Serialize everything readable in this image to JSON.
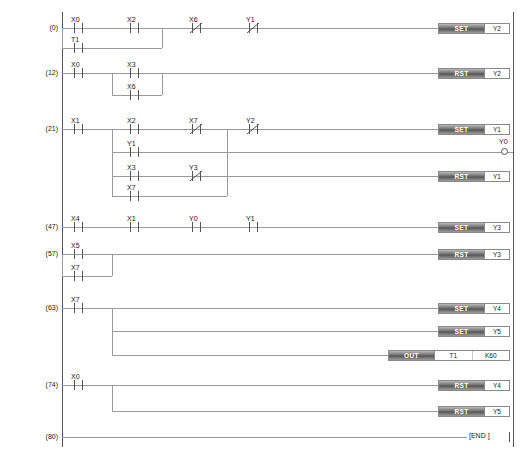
{
  "diagram": {
    "type": "ladder-logic",
    "end_label": "[END  ]",
    "rails": {
      "left_x": 62,
      "right_x": 513
    },
    "rungs": [
      {
        "step": "(0)",
        "y": 28,
        "contacts": [
          {
            "name": "X0",
            "x": 78,
            "type": "no"
          },
          {
            "name": "X2",
            "x": 134,
            "type": "no"
          },
          {
            "name": "X6",
            "x": 196,
            "type": "nc"
          },
          {
            "name": "Y1",
            "x": 253,
            "type": "nc"
          }
        ],
        "branches": [
          {
            "y": 48,
            "from_x": 62,
            "to_x": 162,
            "contacts": [
              {
                "name": "T1",
                "x": 78,
                "type": "no"
              }
            ]
          }
        ],
        "outputs": [
          {
            "op": "SET",
            "args": [
              "Y2"
            ],
            "y": 28
          }
        ]
      },
      {
        "step": "(12)",
        "y": 73,
        "contacts": [
          {
            "name": "X0",
            "x": 78,
            "type": "no"
          },
          {
            "name": "X3",
            "x": 134,
            "type": "no"
          }
        ],
        "branches": [
          {
            "y": 95,
            "from_x": 112,
            "to_x": 162,
            "contacts": [
              {
                "name": "X6",
                "x": 134,
                "type": "no"
              }
            ]
          }
        ],
        "outputs": [
          {
            "op": "RST",
            "args": [
              "Y2"
            ],
            "y": 73
          }
        ]
      },
      {
        "step": "(21)",
        "y": 129,
        "contacts": [
          {
            "name": "X1",
            "x": 78,
            "type": "no"
          },
          {
            "name": "X2",
            "x": 134,
            "type": "no"
          },
          {
            "name": "X7",
            "x": 196,
            "type": "nc"
          },
          {
            "name": "Y2",
            "x": 253,
            "type": "nc"
          }
        ],
        "branches": [
          {
            "y": 152,
            "from_x": 112,
            "to_x": 513,
            "contacts": [
              {
                "name": "Y1",
                "x": 134,
                "type": "no"
              }
            ]
          },
          {
            "y": 176,
            "from_x": 112,
            "to_x": 227,
            "contacts": [
              {
                "name": "X3",
                "x": 134,
                "type": "no"
              },
              {
                "name": "Y3",
                "x": 196,
                "type": "nc"
              }
            ]
          },
          {
            "y": 196,
            "from_x": 112,
            "to_x": 227,
            "contacts": [
              {
                "name": "X7",
                "x": 134,
                "type": "no"
              }
            ]
          }
        ],
        "outputs": [
          {
            "op": "SET",
            "args": [
              "Y1"
            ],
            "y": 129
          },
          {
            "op": "RST",
            "args": [
              "Y1"
            ],
            "y": 176
          }
        ],
        "coils": [
          {
            "name": "Y0",
            "y": 152
          }
        ]
      },
      {
        "step": "(47)",
        "y": 227,
        "contacts": [
          {
            "name": "X4",
            "x": 78,
            "type": "no"
          },
          {
            "name": "X1",
            "x": 134,
            "type": "no"
          },
          {
            "name": "Y0",
            "x": 196,
            "type": "no"
          },
          {
            "name": "Y1",
            "x": 253,
            "type": "no"
          }
        ],
        "branches": [],
        "outputs": [
          {
            "op": "SET",
            "args": [
              "Y3"
            ],
            "y": 227
          }
        ]
      },
      {
        "step": "(57)",
        "y": 254,
        "contacts": [
          {
            "name": "X5",
            "x": 78,
            "type": "no"
          }
        ],
        "branches": [
          {
            "y": 276,
            "from_x": 62,
            "to_x": 112,
            "contacts": [
              {
                "name": "X7",
                "x": 78,
                "type": "no"
              }
            ]
          }
        ],
        "outputs": [
          {
            "op": "RST",
            "args": [
              "Y3"
            ],
            "y": 254
          }
        ]
      },
      {
        "step": "(63)",
        "y": 308,
        "contacts": [
          {
            "name": "X7",
            "x": 78,
            "type": "no"
          }
        ],
        "branches": [
          {
            "y": 331,
            "from_x": 112,
            "to_x": 513,
            "contacts": []
          },
          {
            "y": 355,
            "from_x": 112,
            "to_x": 396,
            "contacts": []
          }
        ],
        "outputs": [
          {
            "op": "SET",
            "args": [
              "Y4"
            ],
            "y": 308
          },
          {
            "op": "SET",
            "args": [
              "Y5"
            ],
            "y": 331
          },
          {
            "op": "OUT",
            "args": [
              "T1",
              "K60"
            ],
            "y": 355
          }
        ]
      },
      {
        "step": "(74)",
        "y": 385,
        "contacts": [
          {
            "name": "X0",
            "x": 78,
            "type": "no"
          }
        ],
        "branches": [
          {
            "y": 411,
            "from_x": 112,
            "to_x": 513,
            "contacts": []
          }
        ],
        "outputs": [
          {
            "op": "RST",
            "args": [
              "Y4"
            ],
            "y": 385
          },
          {
            "op": "RST",
            "args": [
              "Y5"
            ],
            "y": 411
          }
        ]
      },
      {
        "step": "(80)",
        "y": 437,
        "contacts": [],
        "branches": [],
        "outputs": [],
        "is_end": true
      }
    ]
  }
}
